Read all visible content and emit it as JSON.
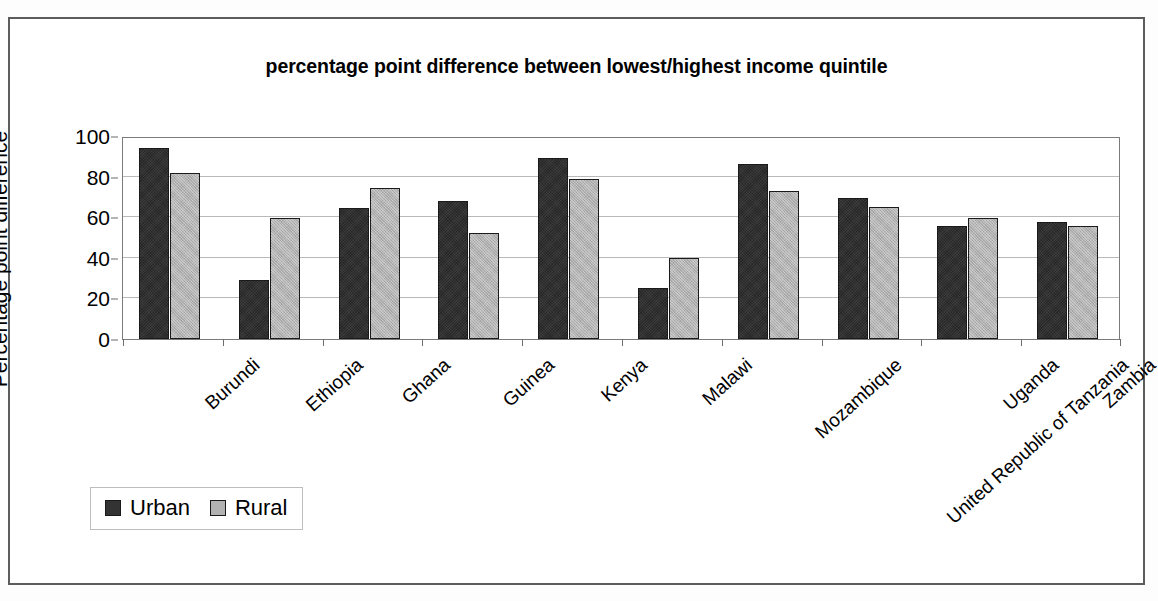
{
  "chart_data": {
    "type": "bar",
    "title": "percentage point difference between lowest/highest income quintile",
    "xlabel": "",
    "ylabel": "Percentage point difference",
    "ylim": [
      0,
      100
    ],
    "yticks": [
      0,
      20,
      40,
      60,
      80,
      100
    ],
    "grid": true,
    "legend_position": "bottom-left",
    "categories": [
      "Burundi",
      "Ethiopia",
      "Ghana",
      "Guinea",
      "Kenya",
      "Malawi",
      "Mozambique",
      "United Republic of Tanzania",
      "Uganda",
      "Zambia"
    ],
    "series": [
      {
        "name": "Urban",
        "color": "#333333",
        "values": [
          94,
          29,
          64.5,
          68,
          89,
          25,
          86,
          69.5,
          55.5,
          57.5
        ]
      },
      {
        "name": "Rural",
        "color": "#b2b2b2",
        "values": [
          82,
          59.5,
          74.5,
          52,
          79,
          40,
          73,
          65,
          59.5,
          55.5
        ]
      }
    ]
  },
  "legend": {
    "items": [
      {
        "label": "Urban",
        "swatch": "urban-swatch"
      },
      {
        "label": "Rural",
        "swatch": "rural-swatch"
      }
    ]
  }
}
